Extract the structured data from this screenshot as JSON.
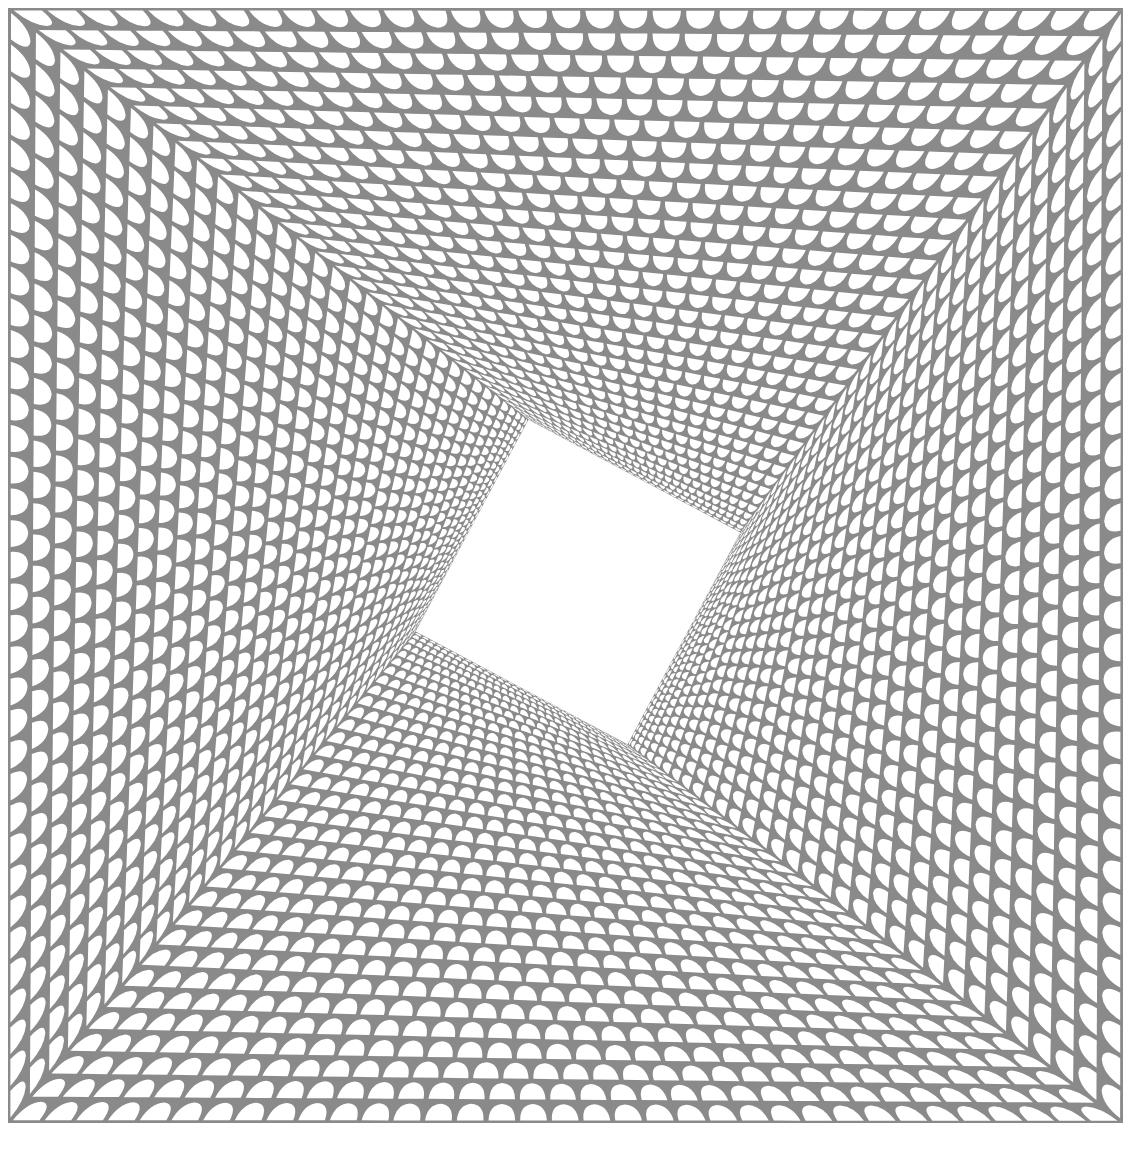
{
  "artwork": {
    "description": "Op-art pattern of concentric square frames filled with rows of white petal shapes that shrink toward a rotated white square at the center",
    "colors": {
      "ground": "#8a8a8a",
      "petal": "#ffffff",
      "paper": "#ffffff"
    },
    "frame": {
      "x": 8,
      "y": 8,
      "size": 1115
    },
    "rings": 11,
    "center": {
      "x": 578,
      "y": 582,
      "half": 120,
      "rotation_deg": 28
    }
  }
}
